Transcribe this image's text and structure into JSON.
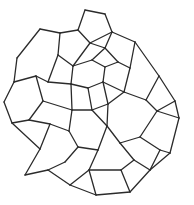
{
  "diagram": {
    "title": "",
    "type": "voronoi-polygon-mesh",
    "stroke_color": "#2b2b2b",
    "background_color": "#ffffff",
    "cell_count_estimate": 34
  }
}
